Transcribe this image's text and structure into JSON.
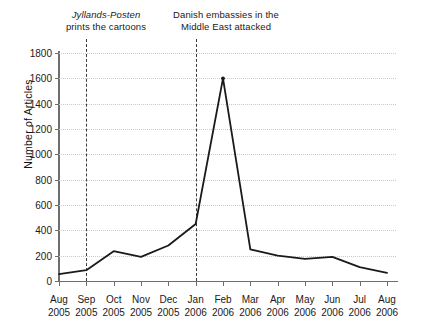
{
  "chart_data": {
    "type": "line",
    "title": "",
    "xlabel": "",
    "ylabel": "Number of Articles",
    "ylim": [
      0,
      1800
    ],
    "ytick_step": 200,
    "grid": true,
    "legend": "none",
    "line_color": "#1a1a1a",
    "categories": [
      "Aug 2005",
      "Sep 2005",
      "Oct 2005",
      "Nov 2005",
      "Dec 2005",
      "Jan 2006",
      "Feb 2006",
      "Mar 2006",
      "Apr 2006",
      "May 2006",
      "Jun 2006",
      "Jul 2006",
      "Aug 2006"
    ],
    "values": [
      55,
      85,
      235,
      190,
      280,
      450,
      1600,
      250,
      200,
      175,
      190,
      110,
      65
    ],
    "yticks": [
      0,
      200,
      400,
      600,
      800,
      1000,
      1200,
      1400,
      1600,
      1800
    ],
    "xticks": [
      {
        "month": "Aug",
        "year": "2005"
      },
      {
        "month": "Sep",
        "year": "2005"
      },
      {
        "month": "Oct",
        "year": "2005"
      },
      {
        "month": "Nov",
        "year": "2005"
      },
      {
        "month": "Dec",
        "year": "2005"
      },
      {
        "month": "Jan",
        "year": "2006"
      },
      {
        "month": "Feb",
        "year": "2006"
      },
      {
        "month": "Mar",
        "year": "2006"
      },
      {
        "month": "Apr",
        "year": "2006"
      },
      {
        "month": "May",
        "year": "2006"
      },
      {
        "month": "Jun",
        "year": "2006"
      },
      {
        "month": "Jul",
        "year": "2006"
      },
      {
        "month": "Aug",
        "year": "2006"
      }
    ],
    "annotations": [
      {
        "id": "cartoons",
        "at_category": "Sep 2005",
        "source": "Jyllands-Posten",
        "line1": "Jyllands-Posten",
        "line2": "prints the cartoons",
        "style": "dashed-vertical"
      },
      {
        "id": "embassies",
        "at_category": "Jan 2006",
        "line1": "Danish embassies in the",
        "line2": "Middle East attacked",
        "style": "dashed-vertical"
      }
    ]
  }
}
